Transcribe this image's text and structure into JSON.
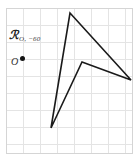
{
  "figure": {
    "background_color": "#ffffff",
    "border_color": "#d8d8d8",
    "grid": {
      "visible": true,
      "line_color": "#e2e2e2",
      "spacing_px": 17,
      "x_start": 6,
      "y_start": 8,
      "columns": 8,
      "rows": 9,
      "border_x": 6,
      "border_y": 8,
      "border_width": 127,
      "border_height": 146
    },
    "labels": {
      "rotation_symbol": "ℛ",
      "rotation_subscript": "O, −60",
      "rotation_full": "ℛO, −60",
      "center_point_label": "O",
      "center_point_x": 22,
      "center_point_y": 58
    },
    "shape": {
      "name": "concave-quadrilateral-dart",
      "stroke_color": "#1a1a1a",
      "stroke_width": 1.6,
      "fill": "none",
      "vertices": [
        {
          "name": "top",
          "x": 70,
          "y": 13
        },
        {
          "name": "right",
          "x": 131,
          "y": 80
        },
        {
          "name": "notch",
          "x": 82,
          "y": 62
        },
        {
          "name": "bottom",
          "x": 51,
          "y": 128
        }
      ],
      "points_attr": "70,13 131,80 82,62 51,128"
    }
  }
}
